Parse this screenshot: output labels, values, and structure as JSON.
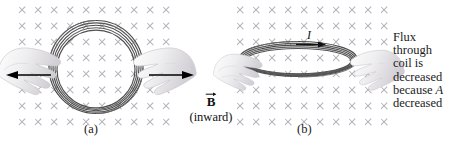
{
  "figure": {
    "domain_note": "physics figure: motional EMF / flux change by area change",
    "background_color": "#ffffff",
    "field_mark_color": "#b3b0bd",
    "coil_color": "#3a3a3a",
    "arrow_color": "#000000",
    "text_color": "#1a1a1a"
  },
  "panel_a": {
    "label": "(a)",
    "field": {
      "symbol": "x",
      "rows": 8,
      "cols": 10,
      "spacing": 16
    },
    "coil": {
      "shape": "circle",
      "turns": 5
    },
    "left_arrow": {
      "direction": "left",
      "label": ""
    },
    "right_arrow": {
      "direction": "right",
      "label": ""
    },
    "hands": [
      "left-hand",
      "right-hand"
    ]
  },
  "panel_b": {
    "label": "(b)",
    "field": {
      "symbol": "x",
      "rows": 8,
      "cols": 10,
      "spacing": 16
    },
    "coil": {
      "shape": "flattened-ellipse",
      "turns": 5
    },
    "current_label": "I",
    "current_arrow": {
      "direction": "right"
    },
    "hands": [
      "left-hand",
      "right-hand"
    ]
  },
  "b_field_label": {
    "symbol": "B",
    "vector_arrow": "right-arrow-overbar",
    "note": "(inward)"
  },
  "caption": {
    "lines": [
      "Flux",
      "through",
      "coil is",
      "decreased",
      "because",
      "decreased"
    ],
    "italic_token": "A"
  }
}
